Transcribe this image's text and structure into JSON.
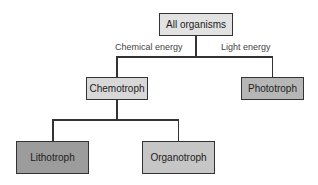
{
  "diagram": {
    "type": "tree",
    "root": {
      "label": "All organisms",
      "color": "#e2e2e2"
    },
    "edges": {
      "left_label": "Chemical energy",
      "right_label": "Light energy"
    },
    "level1": [
      {
        "label": "Chemotroph",
        "color": "#d8d8d8"
      },
      {
        "label": "Phototroph",
        "color": "#b6b6b6"
      }
    ],
    "level2": [
      {
        "label": "Lithotroph",
        "color": "#9c9c9c"
      },
      {
        "label": "Organotroph",
        "color": "#c6c6c6"
      }
    ]
  }
}
